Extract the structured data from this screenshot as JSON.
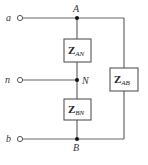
{
  "diagram": {
    "type": "circuit-schematic",
    "colors": {
      "wire": "#666666",
      "node": "#111111",
      "label": "#333333",
      "background": "#ffffff"
    },
    "terminals": [
      {
        "id": "a",
        "label": "a"
      },
      {
        "id": "n",
        "label": "n"
      },
      {
        "id": "b",
        "label": "b"
      }
    ],
    "nodes": [
      {
        "id": "A",
        "label": "A"
      },
      {
        "id": "N",
        "label": "N"
      },
      {
        "id": "B",
        "label": "B"
      }
    ],
    "impedances": [
      {
        "id": "Z_AN",
        "symbol": "Z",
        "subscript": "AN",
        "between": [
          "A",
          "N"
        ]
      },
      {
        "id": "Z_BN",
        "symbol": "Z",
        "subscript": "BN",
        "between": [
          "B",
          "N"
        ]
      },
      {
        "id": "Z_AB",
        "symbol": "Z",
        "subscript": "AB",
        "between": [
          "A",
          "B"
        ]
      }
    ],
    "connections": [
      [
        "a",
        "A"
      ],
      [
        "n",
        "N"
      ],
      [
        "b",
        "B"
      ]
    ]
  }
}
